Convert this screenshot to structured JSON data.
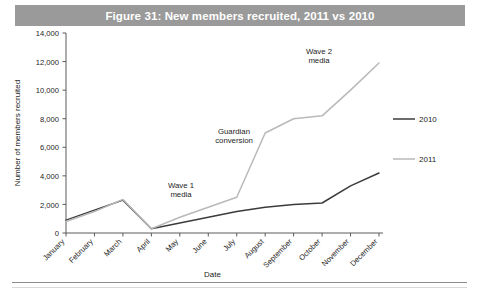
{
  "figure": {
    "title": "Figure 31: New members recruited, 2011 vs 2010",
    "title_bar_color": "#9a9a9a",
    "title_text_color": "#ffffff"
  },
  "chart_data": {
    "type": "line",
    "title": "Figure 31: New members recruited, 2011 vs 2010",
    "xlabel": "Date",
    "ylabel": "Number of members recruited",
    "categories": [
      "January",
      "February",
      "March",
      "April",
      "May",
      "June",
      "July",
      "August",
      "September",
      "October",
      "November",
      "December"
    ],
    "ylim": [
      0,
      14000
    ],
    "ytick_step": 2000,
    "yticks": [
      "0",
      "2,000",
      "4,000",
      "6,000",
      "8,000",
      "10,000",
      "12,000",
      "14,000"
    ],
    "grid": false,
    "legend_position": "right",
    "series": [
      {
        "name": "2010",
        "color": "#3b3b3b",
        "values": [
          900,
          1600,
          2300,
          300,
          700,
          1100,
          1500,
          1800,
          2000,
          2100,
          3300,
          4200
        ]
      },
      {
        "name": "2011",
        "color": "#b9b9b9",
        "values": [
          800,
          1500,
          2350,
          300,
          1100,
          1800,
          2500,
          7000,
          8000,
          8200,
          10000,
          11900
        ]
      }
    ],
    "annotations": [
      {
        "text_line1": "Wave 1",
        "text_line2": "media",
        "near": "April"
      },
      {
        "text_line1": "Guardian",
        "text_line2": "conversion",
        "near": "July"
      },
      {
        "text_line1": "Wave 2",
        "text_line2": "media",
        "near": "October"
      }
    ]
  },
  "legend": {
    "items": [
      {
        "label": "2010",
        "color": "#3b3b3b"
      },
      {
        "label": "2011",
        "color": "#b9b9b9"
      }
    ]
  }
}
